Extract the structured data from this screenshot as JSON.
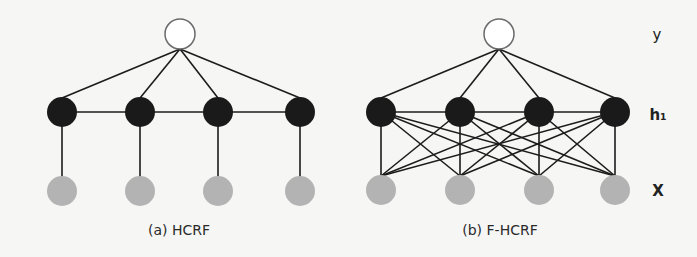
{
  "figure": {
    "panels": [
      {
        "id": "a",
        "caption": "(a) HCRF",
        "caption_pos": [
          179,
          235
        ],
        "label_node": {
          "x": 180,
          "y": 34
        },
        "hidden_nodes": [
          {
            "x": 62,
            "y": 112
          },
          {
            "x": 140,
            "y": 112
          },
          {
            "x": 218,
            "y": 112
          },
          {
            "x": 300,
            "y": 112
          }
        ],
        "observed_nodes": [
          {
            "x": 62,
            "y": 191
          },
          {
            "x": 140,
            "y": 191
          },
          {
            "x": 218,
            "y": 191
          },
          {
            "x": 300,
            "y": 191
          }
        ],
        "fully_connected": false
      },
      {
        "id": "b",
        "caption": "(b) F-HCRF",
        "caption_pos": [
          500,
          235
        ],
        "label_node": {
          "x": 499,
          "y": 34
        },
        "hidden_nodes": [
          {
            "x": 381,
            "y": 112
          },
          {
            "x": 460,
            "y": 112
          },
          {
            "x": 539,
            "y": 112
          },
          {
            "x": 615,
            "y": 112
          }
        ],
        "observed_nodes": [
          {
            "x": 381,
            "y": 190
          },
          {
            "x": 460,
            "y": 190
          },
          {
            "x": 539,
            "y": 190
          },
          {
            "x": 615,
            "y": 190
          }
        ],
        "fully_connected": true
      }
    ],
    "layer_labels": [
      {
        "text": "y",
        "x": 657,
        "y": 40,
        "bold": false
      },
      {
        "text": "h₁",
        "x": 658,
        "y": 120,
        "bold": true
      },
      {
        "text": "X",
        "x": 658,
        "y": 196,
        "bold": true
      }
    ],
    "colors": {
      "background": "#f6f6f5",
      "edge": "#1c1c1c",
      "label_node_fill": "#ffffff",
      "label_node_stroke": "#6a6a6a",
      "hidden_fill": "#1a1a1a",
      "observed_fill": "#b3b3b3"
    },
    "radius": {
      "label": 15,
      "hidden": 15,
      "observed": 15
    }
  }
}
